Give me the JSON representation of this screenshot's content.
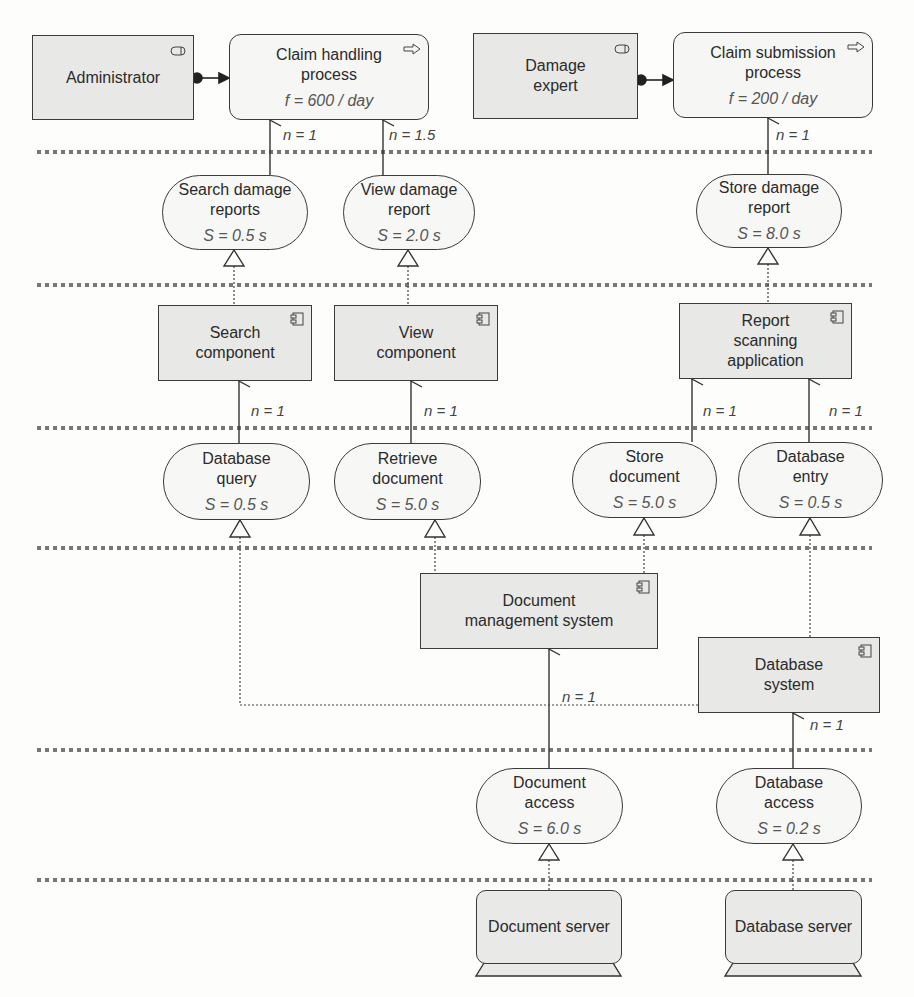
{
  "layers": {
    "separator_count": 6
  },
  "business": {
    "actors": [
      {
        "label": "Administrator",
        "icon": "actor-role-icon"
      },
      {
        "label": "Damage\nexpert",
        "line1": "Damage",
        "line2": "expert",
        "icon": "actor-role-icon"
      }
    ],
    "processes": [
      {
        "line1": "Claim handling",
        "line2": "process",
        "metric": "f = 600 / day",
        "icon": "process-arrow-icon"
      },
      {
        "line1": "Claim submission",
        "line2": "process",
        "metric": "f = 200 / day",
        "icon": "process-arrow-icon"
      }
    ]
  },
  "app_services": [
    {
      "line1": "Search damage",
      "line2": "reports",
      "metric": "S = 0.5 s"
    },
    {
      "line1": "View damage",
      "line2": "report",
      "metric": "S = 2.0 s"
    },
    {
      "line1": "Store damage",
      "line2": "report",
      "metric": "S = 8.0 s"
    }
  ],
  "app_components": [
    {
      "line1": "Search",
      "line2": "component"
    },
    {
      "line1": "View",
      "line2": "component"
    },
    {
      "line1": "Report",
      "line2": "scanning",
      "line3": "application"
    }
  ],
  "infra_services": [
    {
      "line1": "Database",
      "line2": "query",
      "metric": "S = 0.5 s"
    },
    {
      "line1": "Retrieve",
      "line2": "document",
      "metric": "S = 5.0 s"
    },
    {
      "line1": "Store",
      "line2": "document",
      "metric": "S = 5.0 s"
    },
    {
      "line1": "Database",
      "line2": "entry",
      "metric": "S = 0.5 s"
    }
  ],
  "systems": [
    {
      "line1": "Document",
      "line2": "management system"
    },
    {
      "line1": "Database",
      "line2": "system"
    }
  ],
  "tech_services": [
    {
      "line1": "Document",
      "line2": "access",
      "metric": "S = 6.0 s"
    },
    {
      "line1": "Database",
      "line2": "access",
      "metric": "S = 0.2 s"
    }
  ],
  "devices": [
    {
      "label": "Document server"
    },
    {
      "label": "Database server"
    }
  ],
  "edge_labels": {
    "claim_handling_search": "n = 1",
    "claim_handling_view": "n = 1.5",
    "claim_submission_store": "n = 1",
    "search_comp_dbquery": "n = 1",
    "view_comp_retrieve": "n = 1",
    "report_scan_store_doc": "n = 1",
    "report_scan_db_entry": "n = 1",
    "dms_doc_access": "n = 1",
    "dbsys_db_access": "n = 1"
  }
}
